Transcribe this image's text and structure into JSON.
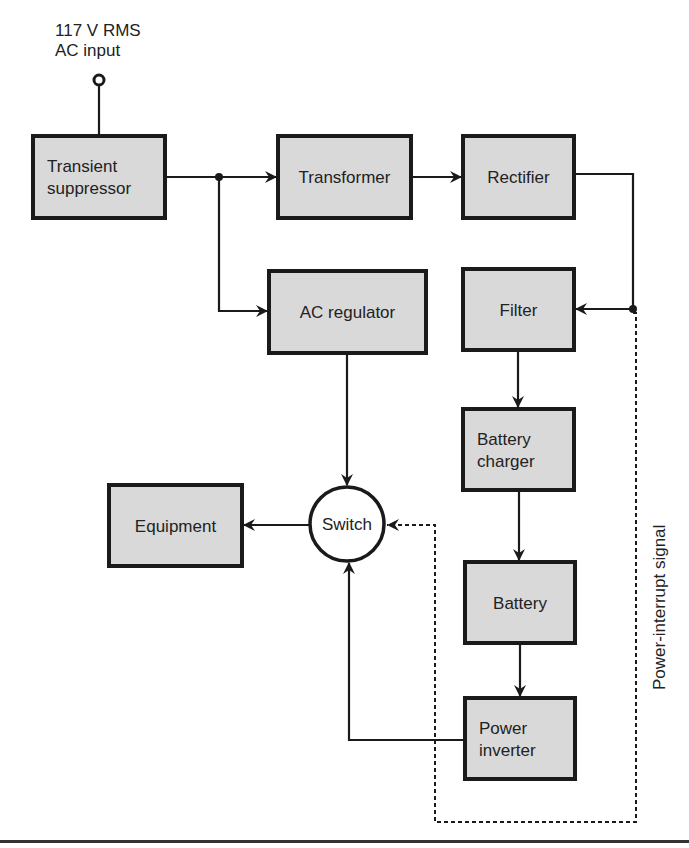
{
  "diagram": {
    "input_label_line1": "117 V RMS",
    "input_label_line2": "AC input",
    "side_label": "Power-interrupt signal",
    "colors": {
      "box_fill": "#d9d9d9",
      "stroke": "#1a1a1a"
    },
    "nodes": [
      {
        "id": "transient",
        "lines": [
          "Transient",
          "suppressor"
        ],
        "x": 33,
        "y": 136,
        "w": 132,
        "h": 82
      },
      {
        "id": "transformer",
        "lines": [
          "Transformer"
        ],
        "x": 278,
        "y": 136,
        "w": 133,
        "h": 82
      },
      {
        "id": "rectifier",
        "lines": [
          "Rectifier"
        ],
        "x": 463,
        "y": 136,
        "w": 111,
        "h": 82
      },
      {
        "id": "ac-regulator",
        "lines": [
          "AC regulator"
        ],
        "x": 269,
        "y": 271,
        "w": 157,
        "h": 82
      },
      {
        "id": "filter",
        "lines": [
          "Filter"
        ],
        "x": 463,
        "y": 269,
        "w": 111,
        "h": 81
      },
      {
        "id": "battery-charger",
        "lines": [
          "Battery",
          "charger"
        ],
        "x": 463,
        "y": 409,
        "w": 111,
        "h": 81
      },
      {
        "id": "equipment",
        "lines": [
          "Equipment"
        ],
        "x": 109,
        "y": 485,
        "w": 133,
        "h": 81
      },
      {
        "id": "battery",
        "lines": [
          "Battery"
        ],
        "x": 465,
        "y": 562,
        "w": 110,
        "h": 81
      },
      {
        "id": "power-inverter",
        "lines": [
          "Power",
          "inverter"
        ],
        "x": 465,
        "y": 698,
        "w": 110,
        "h": 81
      }
    ],
    "switch": {
      "label": "Switch",
      "cx": 347,
      "cy": 524,
      "r": 37
    },
    "edges": [
      {
        "from": "ac-input",
        "to": "transient"
      },
      {
        "from": "transient",
        "to": "transformer"
      },
      {
        "from": "transient",
        "to": "ac-regulator"
      },
      {
        "from": "transformer",
        "to": "rectifier"
      },
      {
        "from": "rectifier",
        "to": "filter"
      },
      {
        "from": "filter",
        "to": "battery-charger"
      },
      {
        "from": "battery-charger",
        "to": "battery"
      },
      {
        "from": "battery",
        "to": "power-inverter"
      },
      {
        "from": "ac-regulator",
        "to": "switch"
      },
      {
        "from": "power-inverter",
        "to": "switch"
      },
      {
        "from": "switch",
        "to": "equipment"
      },
      {
        "from": "rectifier",
        "to": "switch",
        "style": "dashed",
        "label": "Power-interrupt signal"
      }
    ]
  }
}
